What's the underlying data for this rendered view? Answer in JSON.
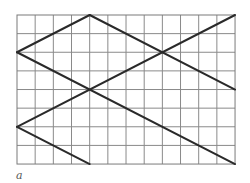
{
  "figure": {
    "caption": "a",
    "grid": {
      "columns": 12,
      "rows": 8,
      "origin_px": [
        17,
        15
      ],
      "cell_w_px": 18.17,
      "cell_h_px": 18.63,
      "line_color": "#8a8a8a"
    },
    "line_color": "#2a2a2a",
    "segments_grid_units": [
      {
        "from": [
          0,
          2
        ],
        "to": [
          4,
          0
        ]
      },
      {
        "from": [
          4,
          0
        ],
        "to": [
          12,
          4
        ]
      },
      {
        "from": [
          0,
          2
        ],
        "to": [
          12,
          8
        ]
      },
      {
        "from": [
          0,
          6
        ],
        "to": [
          12,
          0
        ]
      },
      {
        "from": [
          0,
          6
        ],
        "to": [
          4,
          8
        ]
      }
    ]
  }
}
